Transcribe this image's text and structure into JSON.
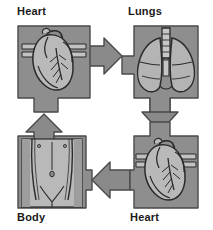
{
  "diagram": {
    "type": "cycle-flow",
    "background_color": "#ffffff",
    "panel_fill": "#8e8e8e",
    "panel_stroke": "#4a4a4a",
    "arrow_fill": "#8a8a8a",
    "arrow_stroke": "#4a4a4a",
    "organ_fill": "#b9b9b9",
    "organ_stroke": "#2b2b2b",
    "label_color": "#1a1a1a",
    "nodes": [
      {
        "id": "heart-top",
        "label": "Heart",
        "icon": "heart-organ-icon",
        "position": "top-left",
        "label_position": "above"
      },
      {
        "id": "lungs",
        "label": "Lungs",
        "icon": "lungs-organ-icon",
        "position": "top-right",
        "label_position": "above"
      },
      {
        "id": "heart-bottom",
        "label": "Heart",
        "icon": "heart-organ-icon",
        "position": "bottom-right",
        "label_position": "below"
      },
      {
        "id": "body",
        "label": "Body",
        "icon": "body-torso-icon",
        "position": "bottom-left",
        "label_position": "below"
      }
    ],
    "arrows": [
      {
        "id": "arrow-heart-to-lungs",
        "from": "heart-top",
        "to": "lungs",
        "direction": "right"
      },
      {
        "id": "arrow-lungs-to-heart",
        "from": "lungs",
        "to": "heart-bottom",
        "direction": "down"
      },
      {
        "id": "arrow-heart-to-body",
        "from": "heart-bottom",
        "to": "body",
        "direction": "left"
      },
      {
        "id": "arrow-body-to-heart",
        "from": "body",
        "to": "heart-top",
        "direction": "up"
      }
    ]
  }
}
